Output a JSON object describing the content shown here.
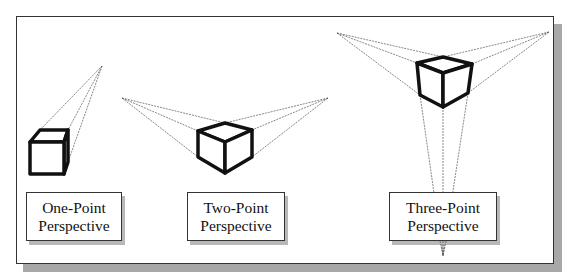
{
  "figure": {
    "clipped_caption": "",
    "background": "#ffffff",
    "frame_border": "#333333",
    "shadow_color": "#a8a8a8",
    "cube_stroke": "#111111",
    "projector_stroke": "#555555"
  },
  "panels": [
    {
      "id": "one-point",
      "label_line1": "One-Point",
      "label_line2": "Perspective",
      "vanishing_points": [
        [
          102,
          66
        ]
      ]
    },
    {
      "id": "two-point",
      "label_line1": "Two-Point",
      "label_line2": "Perspective",
      "vanishing_points": [
        [
          122,
          98
        ],
        [
          328,
          98
        ]
      ]
    },
    {
      "id": "three-point",
      "label_line1": "Three-Point",
      "label_line2": "Perspective",
      "vanishing_points": [
        [
          337,
          33
        ],
        [
          549,
          32
        ],
        [
          443,
          256
        ]
      ]
    }
  ]
}
